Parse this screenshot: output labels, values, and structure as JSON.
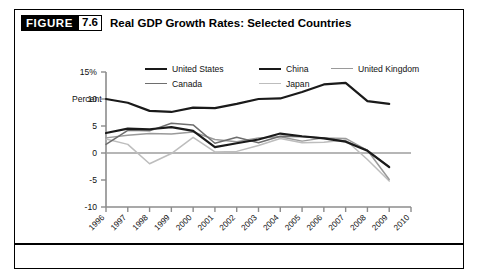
{
  "figure": {
    "badge_label": "FIGURE",
    "number": "7.6",
    "title": "Real GDP Growth Rates: Selected Countries"
  },
  "chart_data": {
    "type": "line",
    "title": "Real GDP Growth Rates: Selected Countries",
    "xlabel": "Year",
    "ylabel": "Percent",
    "ylim": [
      -10,
      15
    ],
    "xlim": [
      1996,
      2010
    ],
    "yticks": [
      "15%",
      "10",
      "5",
      "0",
      "-5",
      "-10"
    ],
    "ytick_values": [
      15,
      10,
      5,
      0,
      -5,
      -10
    ],
    "grid": false,
    "zero_line": true,
    "legend_position": "top",
    "x": [
      1996,
      1997,
      1998,
      1999,
      2000,
      2001,
      2002,
      2003,
      2004,
      2005,
      2006,
      2007,
      2008,
      2009,
      2010
    ],
    "categories": [
      "1996",
      "1997",
      "1998",
      "1999",
      "2000",
      "2001",
      "2002",
      "2003",
      "2004",
      "2005",
      "2006",
      "2007",
      "2008",
      "2009",
      "2010"
    ],
    "series": [
      {
        "name": "United States",
        "color": "#1a1a1a",
        "width": 2.2,
        "values": [
          3.7,
          4.5,
          4.4,
          4.8,
          4.1,
          1.1,
          1.8,
          2.5,
          3.6,
          3.1,
          2.7,
          2.1,
          0.4,
          -2.6,
          null
        ]
      },
      {
        "name": "China",
        "color": "#1a1a1a",
        "width": 2.2,
        "values": [
          10.0,
          9.3,
          7.8,
          7.6,
          8.4,
          8.3,
          9.1,
          10.0,
          10.1,
          11.3,
          12.7,
          13.0,
          9.6,
          9.1,
          null
        ]
      },
      {
        "name": "United Kingdom",
        "color": "#9a9a9a",
        "width": 1.5,
        "values": [
          2.8,
          3.3,
          3.6,
          3.5,
          3.9,
          2.5,
          2.1,
          2.8,
          3.0,
          2.2,
          2.8,
          2.7,
          0.5,
          -4.9,
          null
        ]
      },
      {
        "name": "Canada",
        "color": "#6e6e6e",
        "width": 1.5,
        "values": [
          1.6,
          4.2,
          4.1,
          5.5,
          5.2,
          1.8,
          2.9,
          1.9,
          3.1,
          3.0,
          2.8,
          2.2,
          0.5,
          -2.5,
          null
        ]
      },
      {
        "name": "Japan",
        "color": "#bdbdbd",
        "width": 1.5,
        "values": [
          2.6,
          1.6,
          -2.0,
          -0.1,
          2.9,
          0.2,
          0.3,
          1.4,
          2.7,
          1.9,
          2.0,
          2.4,
          -1.2,
          -5.2,
          null
        ]
      }
    ]
  },
  "legend": [
    {
      "label": "United States",
      "color": "#1a1a1a",
      "width": 2.2
    },
    {
      "label": "China",
      "color": "#1a1a1a",
      "width": 2.2
    },
    {
      "label": "United Kingdom",
      "color": "#9a9a9a",
      "width": 1.5
    },
    {
      "label": "Canada",
      "color": "#6e6e6e",
      "width": 1.5
    },
    {
      "label": "Japan",
      "color": "#bdbdbd",
      "width": 1.5
    }
  ],
  "colors": {
    "frame": "#000000",
    "badge_bg": "#000000",
    "badge_text": "#ffffff",
    "axis": "#8c8c8c",
    "zero_line": "#9e9e9e",
    "text": "#111111"
  }
}
